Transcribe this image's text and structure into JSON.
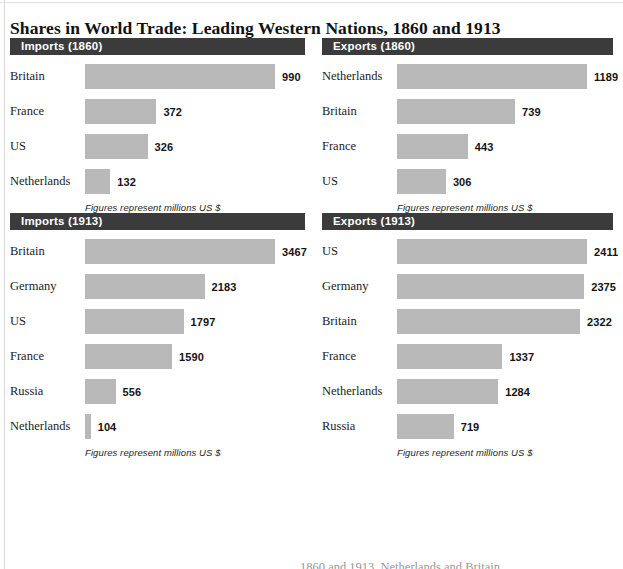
{
  "title": "Shares in World Trade: Leading Western Nations, 1860 and 1913",
  "footnote": "Figures represent millions US $",
  "page_bottom_partial_text": "1860 and 1913. Netherlands and Britain",
  "colors": {
    "header_bar": "#3b3b3b",
    "header_text": "#ffffff",
    "bar_fill": "#b9b9b9",
    "page_background": "#ffffff",
    "body_text": "#1c1c1c"
  },
  "chart_data": [
    {
      "type": "bar",
      "title": "Imports (1860)",
      "orientation": "horizontal",
      "xlabel": "",
      "ylabel": "",
      "unit": "millions US $",
      "note": "Figures represent millions US $",
      "categories": [
        "Britain",
        "France",
        "US",
        "Netherlands"
      ],
      "values": [
        990,
        372,
        326,
        132
      ],
      "xlim": [
        0,
        990
      ],
      "grid": false,
      "legend": "none"
    },
    {
      "type": "bar",
      "title": "Exports (1860)",
      "orientation": "horizontal",
      "xlabel": "",
      "ylabel": "",
      "unit": "millions US $",
      "note": "Figures represent millions US $",
      "categories": [
        "Netherlands",
        "Britain",
        "France",
        "US"
      ],
      "values": [
        1189,
        739,
        443,
        306
      ],
      "xlim": [
        0,
        1189
      ],
      "grid": false,
      "legend": "none"
    },
    {
      "type": "bar",
      "title": "Imports (1913)",
      "orientation": "horizontal",
      "xlabel": "",
      "ylabel": "",
      "unit": "millions US $",
      "note": "Figures represent millions US $",
      "categories": [
        "Britain",
        "Germany",
        "US",
        "France",
        "Russia",
        "Netherlands"
      ],
      "values": [
        3467,
        2183,
        1797,
        1590,
        556,
        104
      ],
      "xlim": [
        0,
        3467
      ],
      "grid": false,
      "legend": "none"
    },
    {
      "type": "bar",
      "title": "Exports (1913)",
      "orientation": "horizontal",
      "xlabel": "",
      "ylabel": "",
      "unit": "millions US $",
      "note": "Figures represent millions US $",
      "categories": [
        "US",
        "Germany",
        "Britain",
        "France",
        "Netherlands",
        "Russia"
      ],
      "values": [
        2411,
        2375,
        2322,
        1337,
        1284,
        719
      ],
      "xlim": [
        0,
        2411
      ],
      "grid": false,
      "legend": "none"
    }
  ]
}
